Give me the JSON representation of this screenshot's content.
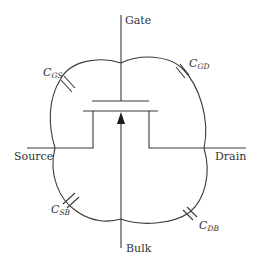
{
  "diagram": {
    "type": "MOSFET parasitic capacitance diagram",
    "terminals": {
      "gate": "Gate",
      "source": "Source",
      "drain": "Drain",
      "bulk": "Bulk"
    },
    "capacitors": [
      {
        "id": "cgs",
        "symbol": "C",
        "subscript": "GS",
        "between": [
          "Gate",
          "Source"
        ]
      },
      {
        "id": "cgd",
        "symbol": "C",
        "subscript": "GD",
        "between": [
          "Gate",
          "Drain"
        ]
      },
      {
        "id": "csb",
        "symbol": "C",
        "subscript": "SB",
        "between": [
          "Source",
          "Bulk"
        ]
      },
      {
        "id": "cdb",
        "symbol": "C",
        "subscript": "DB",
        "between": [
          "Drain",
          "Bulk"
        ]
      }
    ],
    "colors": {
      "line": "#3a3a3a",
      "text": "#333333",
      "background": "#ffffff"
    }
  }
}
